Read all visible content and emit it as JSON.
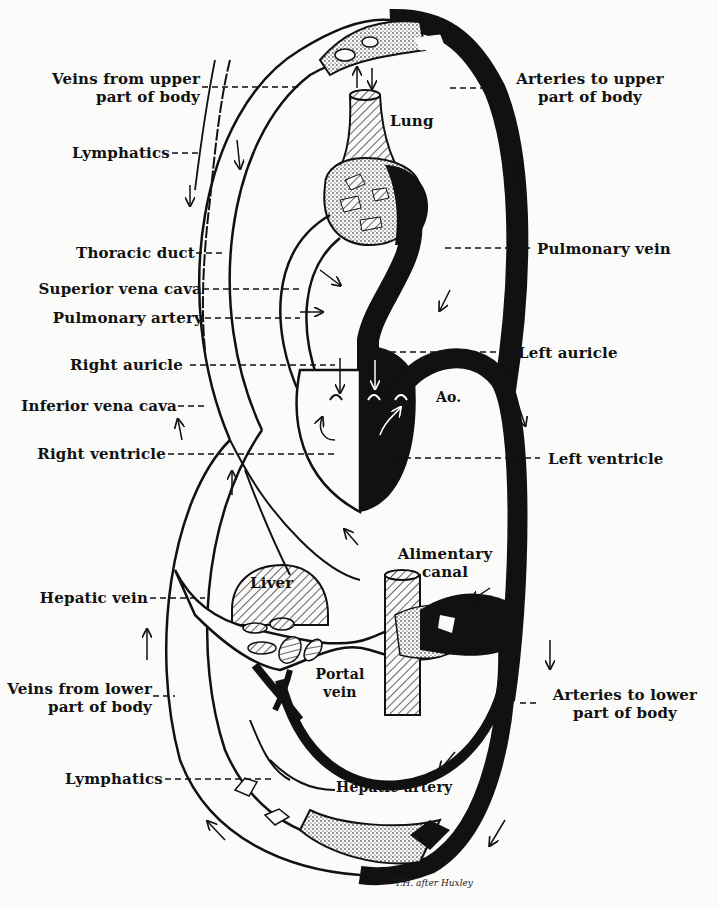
{
  "figure": {
    "signature": "T.H. after Huxley"
  },
  "labels_left": [
    {
      "id": "veins-upper",
      "text": "Veins from upper\npart of body"
    },
    {
      "id": "lymphatics-upper",
      "text": "Lymphatics"
    },
    {
      "id": "thoracic-duct",
      "text": "Thoracic duct"
    },
    {
      "id": "superior-vena-cava",
      "text": "Superior vena cava"
    },
    {
      "id": "pulmonary-artery",
      "text": "Pulmonary artery"
    },
    {
      "id": "right-auricle",
      "text": "Right auricle"
    },
    {
      "id": "inferior-vena-cava",
      "text": "Inferior vena cava"
    },
    {
      "id": "right-ventricle",
      "text": "Right ventricle"
    },
    {
      "id": "hepatic-vein",
      "text": "Hepatic vein"
    },
    {
      "id": "veins-lower",
      "text": "Veins from lower\npart of body"
    },
    {
      "id": "lymphatics-lower",
      "text": "Lymphatics"
    }
  ],
  "labels_right": [
    {
      "id": "arteries-upper",
      "text": "Arteries to upper\npart of body"
    },
    {
      "id": "pulmonary-vein",
      "text": "Pulmonary vein"
    },
    {
      "id": "left-auricle",
      "text": "Left auricle"
    },
    {
      "id": "left-ventricle",
      "text": "Left ventricle"
    },
    {
      "id": "arteries-lower",
      "text": "Arteries to lower\npart of body"
    }
  ],
  "labels_inner": {
    "lung": "Lung",
    "aorta": "Ao.",
    "liver": "Liver",
    "alimentary_canal": "Alimentary\ncanal",
    "portal_vein": "Portal\nvein",
    "hepatic_artery": "Hepatic artery"
  },
  "colors": {
    "ink": "#111111",
    "paper": "#fbfbf9"
  }
}
